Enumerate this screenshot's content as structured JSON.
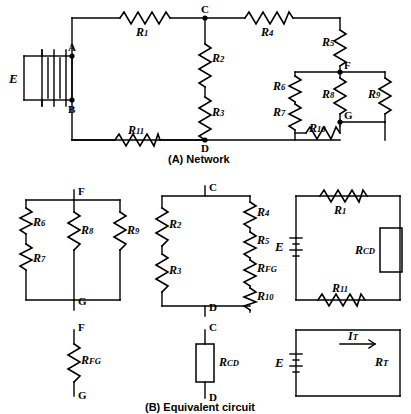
{
  "figure": {
    "caption_a": "(A) Network",
    "caption_b": "(B) Equivalent circuit"
  },
  "panel_a": {
    "source_label": "E",
    "nodes": [
      {
        "name": "A",
        "label": "A"
      },
      {
        "name": "B",
        "label": "B"
      },
      {
        "name": "C",
        "label": "C"
      },
      {
        "name": "D",
        "label": "D"
      },
      {
        "name": "F",
        "label": "F"
      },
      {
        "name": "G",
        "label": "G"
      }
    ],
    "resistors": [
      {
        "name": "R1",
        "base": "R",
        "sub": "1"
      },
      {
        "name": "R2",
        "base": "R",
        "sub": "2"
      },
      {
        "name": "R3",
        "base": "R",
        "sub": "3"
      },
      {
        "name": "R4",
        "base": "R",
        "sub": "4"
      },
      {
        "name": "R5",
        "base": "R",
        "sub": "5"
      },
      {
        "name": "R6",
        "base": "R",
        "sub": "6"
      },
      {
        "name": "R7",
        "base": "R",
        "sub": "7"
      },
      {
        "name": "R8",
        "base": "R",
        "sub": "8"
      },
      {
        "name": "R9",
        "base": "R",
        "sub": "9"
      },
      {
        "name": "R10",
        "base": "R",
        "sub": "10"
      },
      {
        "name": "R11",
        "base": "R",
        "sub": "11"
      }
    ]
  },
  "panel_b": {
    "circuit1": {
      "nodes": [
        {
          "name": "F",
          "label": "F"
        },
        {
          "name": "G",
          "label": "G"
        }
      ],
      "resistors": [
        {
          "name": "R6",
          "base": "R",
          "sub": "6"
        },
        {
          "name": "R7",
          "base": "R",
          "sub": "7"
        },
        {
          "name": "R8",
          "base": "R",
          "sub": "8"
        },
        {
          "name": "R9",
          "base": "R",
          "sub": "9"
        }
      ]
    },
    "circuit2": {
      "nodes": [
        {
          "name": "C",
          "label": "C"
        },
        {
          "name": "D",
          "label": "D"
        }
      ],
      "resistors": [
        {
          "name": "R2",
          "base": "R",
          "sub": "2"
        },
        {
          "name": "R3",
          "base": "R",
          "sub": "3"
        },
        {
          "name": "R4",
          "base": "R",
          "sub": "4"
        },
        {
          "name": "R5",
          "base": "R",
          "sub": "5"
        },
        {
          "name": "RFG",
          "base": "R",
          "sub": "FG"
        },
        {
          "name": "R10",
          "base": "R",
          "sub": "10"
        }
      ]
    },
    "circuit3": {
      "source_label": "E",
      "resistors": [
        {
          "name": "R1",
          "base": "R",
          "sub": "1"
        },
        {
          "name": "RCD",
          "base": "R",
          "sub": "CD"
        },
        {
          "name": "R11",
          "base": "R",
          "sub": "11"
        }
      ]
    },
    "circuit4": {
      "nodes": [
        {
          "name": "F",
          "label": "F"
        },
        {
          "name": "G",
          "label": "G"
        }
      ],
      "resistors": [
        {
          "name": "RFG",
          "base": "R",
          "sub": "FG"
        }
      ]
    },
    "circuit5": {
      "nodes": [
        {
          "name": "C",
          "label": "C"
        },
        {
          "name": "D",
          "label": "D"
        }
      ],
      "resistors": [
        {
          "name": "RCD",
          "base": "R",
          "sub": "CD"
        }
      ]
    },
    "circuit6": {
      "source_label": "E",
      "current_label": "I",
      "current_sub": "T",
      "resistors": [
        {
          "name": "RT",
          "base": "R",
          "sub": "T"
        }
      ]
    }
  }
}
